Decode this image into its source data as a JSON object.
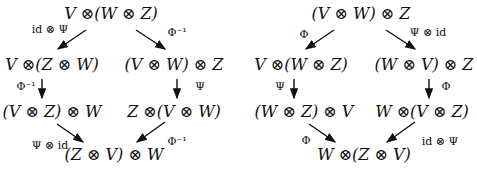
{
  "diagrams": [
    {
      "name": "left-hexagon",
      "nodes": {
        "top": "V ⊗(W ⊗ Z)",
        "mid_left": "V ⊗(Z ⊗ W)",
        "mid_right": "(V ⊗ W) ⊗ Z",
        "low_left": "(V ⊗ Z) ⊗ W",
        "low_right": "Z ⊗(V ⊗ W)",
        "bottom": "(Z ⊗ V) ⊗ W"
      },
      "labels": {
        "top_to_mid_left": "id ⊗ Ψ",
        "top_to_mid_right": "Φ⁻¹",
        "mid_left_to_low_left": "Φ⁻¹",
        "mid_right_to_low_right": "Ψ",
        "low_left_to_bottom": "Ψ ⊗ id",
        "low_right_to_bottom": "Φ⁻¹"
      }
    },
    {
      "name": "right-hexagon",
      "nodes": {
        "top": "(V ⊗ W) ⊗ Z",
        "mid_left": "V ⊗(W ⊗ Z)",
        "mid_right": "(W ⊗ V) ⊗ Z",
        "low_left": "(W ⊗ Z) ⊗ V",
        "low_right": "W ⊗(V ⊗ Z)",
        "bottom": "W ⊗(Z ⊗ V)"
      },
      "labels": {
        "top_to_mid_left": "Φ",
        "top_to_mid_right": "Ψ ⊗ id",
        "mid_left_to_low_left": "Ψ",
        "mid_right_to_low_right": "Φ",
        "low_left_to_bottom": "Φ",
        "low_right_to_bottom": "id ⊗ Ψ"
      }
    }
  ]
}
